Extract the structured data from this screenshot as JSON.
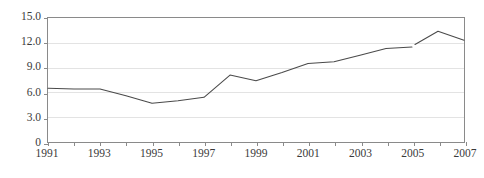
{
  "chart_data": {
    "type": "line",
    "title": "",
    "subtitle": "",
    "xlabel": "",
    "ylabel": "",
    "x": [
      1991,
      1992,
      1993,
      1994,
      1995,
      1996,
      1997,
      1998,
      1999,
      2000,
      2001,
      2002,
      2003,
      2004,
      2005,
      2006,
      2007
    ],
    "values": [
      6.5,
      6.4,
      6.4,
      5.6,
      4.7,
      5.0,
      5.4,
      8.1,
      7.4,
      8.4,
      9.5,
      9.7,
      10.5,
      11.3,
      11.5,
      13.4,
      12.3
    ],
    "series": [
      {
        "name": "",
        "values": [
          6.5,
          6.4,
          6.4,
          5.6,
          4.7,
          5.0,
          5.4,
          8.1,
          7.4,
          8.4,
          9.5,
          9.7,
          10.5,
          11.3,
          11.5,
          13.4,
          12.3
        ]
      }
    ],
    "break_after_x": 2005,
    "break_resume_value": 11.8,
    "xlim": [
      1991,
      2007
    ],
    "ylim": [
      0,
      15
    ],
    "y_ticks": [
      0,
      3,
      6,
      9,
      12,
      15
    ],
    "y_tick_labels": [
      "0",
      "3.0",
      "6.0",
      "9.0",
      "12.0",
      "15.0"
    ],
    "x_ticks": [
      1991,
      1992,
      1993,
      1994,
      1995,
      1996,
      1997,
      1998,
      1999,
      2000,
      2001,
      2002,
      2003,
      2004,
      2005,
      2006,
      2007
    ],
    "x_tick_labels": [
      "1991",
      "",
      "1993",
      "",
      "1995",
      "",
      "1997",
      "",
      "1999",
      "",
      "2001",
      "",
      "2003",
      "",
      "2005",
      "",
      "2007"
    ],
    "x_labeled_ticks": [
      "1991",
      "1993",
      "1995",
      "1997",
      "1999",
      "2001",
      "2003",
      "2005",
      "2007"
    ],
    "grid": "horizontal",
    "legend": "none",
    "colors": {
      "line": "#4a4a4a",
      "grid": "#e3e3e3",
      "axis": "#8a8a8a",
      "text": "#3a3a3a",
      "background": "#ffffff"
    }
  }
}
